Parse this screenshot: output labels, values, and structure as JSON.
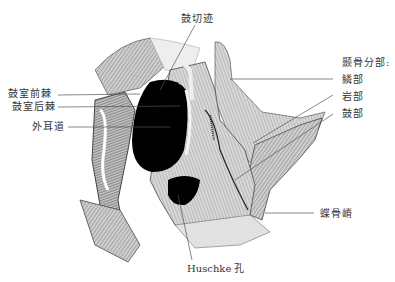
{
  "figure": {
    "corner_mark": "",
    "labels": {
      "tympanic_notch": "鼓切迹",
      "anterior_tympanic_spine": "鼓室前棘",
      "posterior_tympanic_spine": "鼓室后棘",
      "external_acoustic_meatus": "外耳道",
      "temporal_parts_heading": "颞骨分部:",
      "squamous_part": "鳞部",
      "petrous_part": "岩部",
      "tympanic_part": "鼓部",
      "sphenoid_spine": "蝶骨嵴",
      "huschke_foramen": "Huschke 孔"
    },
    "colors": {
      "ink": "#222222",
      "bone_shade": "#9a9a9a",
      "bone_light": "#d4d4d4",
      "cavity": "#000000",
      "leader_line": "#555555"
    }
  }
}
